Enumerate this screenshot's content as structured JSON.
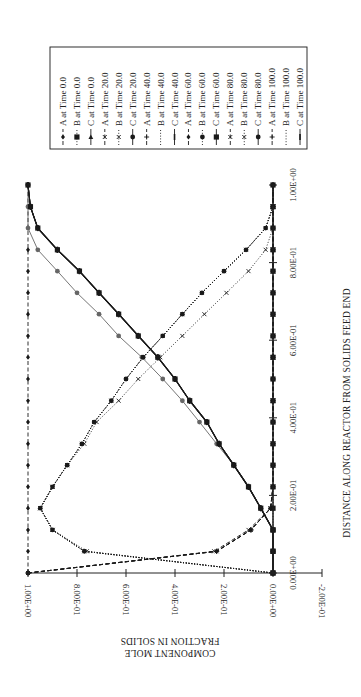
{
  "chart_data": {
    "type": "line",
    "orientation": "rotated 90° counter-clockwise (distance axis vertical, mole fraction axis horizontal)",
    "title": "",
    "xlabel": "DISTANCE ALONG REACTOR FROM SOLIDS FEED END",
    "ylabel": "COMPONENT MOLE FRACTION IN SOLIDS",
    "xlim": [
      0,
      1.0
    ],
    "ylim": [
      -0.2,
      1.0
    ],
    "x_ticks": [
      "0.00E+00",
      "2.00E-01",
      "4.00E-01",
      "6.00E-01",
      "8.00E-01",
      "1.00E+00"
    ],
    "y_ticks": [
      "1.00E+00",
      "8.00E-01",
      "6.00E-01",
      "4.00E-01",
      "2.00E-01",
      "0.00E+00",
      "-2.00E-01"
    ],
    "grid": false,
    "legend_position": "top-right (rotated)",
    "x": [
      0.0,
      0.056,
      0.111,
      0.167,
      0.222,
      0.278,
      0.333,
      0.389,
      0.444,
      0.5,
      0.556,
      0.611,
      0.667,
      0.722,
      0.778,
      0.833,
      0.889,
      0.944,
      1.0
    ],
    "series": [
      {
        "name": "A at Time 0.0",
        "style": "dashed",
        "marker": "diamond",
        "values": [
          1,
          1,
          1,
          1,
          1,
          1,
          1,
          1,
          1,
          1,
          1,
          1,
          1,
          1,
          1,
          1,
          1,
          1,
          1
        ]
      },
      {
        "name": "B at Time 0.0",
        "style": "dotted",
        "marker": "square",
        "values": [
          0,
          0,
          0,
          0,
          0,
          0,
          0,
          0,
          0,
          0,
          0,
          0,
          0,
          0,
          0,
          0,
          0,
          0,
          0
        ]
      },
      {
        "name": "C at Time 0.0",
        "style": "solid",
        "marker": "triangle",
        "values": [
          0,
          0,
          0,
          0,
          0,
          0,
          0,
          0,
          0,
          0,
          0,
          0,
          0,
          0,
          0,
          0,
          0,
          0,
          0
        ]
      },
      {
        "name": "A at Time 20.0",
        "style": "dashed",
        "marker": "x",
        "values": [
          1.0,
          0.24,
          0.1,
          0.01,
          0,
          0,
          0,
          0,
          0,
          0,
          0,
          0,
          0,
          0,
          0,
          0,
          0,
          0,
          0
        ]
      },
      {
        "name": "B at Time 20.0",
        "style": "dotted",
        "marker": "x",
        "values": [
          0,
          0.76,
          0.9,
          0.95,
          0.9,
          0.84,
          0.77,
          0.72,
          0.63,
          0.55,
          0.46,
          0.37,
          0.28,
          0.19,
          0.1,
          0.03,
          0,
          0,
          0
        ]
      },
      {
        "name": "C at Time 20.0",
        "style": "solid",
        "marker": "circle",
        "values": [
          0,
          0,
          0,
          0.05,
          0.1,
          0.16,
          0.23,
          0.3,
          0.37,
          0.45,
          0.535,
          0.63,
          0.71,
          0.8,
          0.88,
          0.96,
          1.0,
          1.0,
          1.0
        ]
      },
      {
        "name": "A at Time 40.0",
        "style": "dashed",
        "marker": "plus",
        "values": [
          1.0,
          0.23,
          0.09,
          0.01,
          0,
          0,
          0,
          0,
          0,
          0,
          0,
          0,
          0,
          0,
          0,
          0,
          0,
          0,
          0
        ]
      },
      {
        "name": "B at Time 40.0",
        "style": "dotted",
        "marker": "none",
        "values": [
          0,
          0.77,
          0.9,
          0.95,
          0.9,
          0.84,
          0.78,
          0.73,
          0.66,
          0.6,
          0.53,
          0.45,
          0.37,
          0.29,
          0.2,
          0.11,
          0.03,
          0,
          0
        ]
      },
      {
        "name": "C at Time 40.0",
        "style": "solid",
        "marker": "bar",
        "values": [
          0,
          0,
          0,
          0.05,
          0.1,
          0.16,
          0.22,
          0.27,
          0.34,
          0.4,
          0.47,
          0.55,
          0.63,
          0.71,
          0.79,
          0.88,
          0.96,
          0.99,
          1.0
        ]
      },
      {
        "name": "A at Time 60.0",
        "style": "dashed",
        "marker": "diamond",
        "values": [
          1.0,
          0.23,
          0.09,
          0.01,
          0,
          0,
          0,
          0,
          0,
          0,
          0,
          0,
          0,
          0,
          0,
          0,
          0,
          0,
          0
        ]
      },
      {
        "name": "B at Time 60.0",
        "style": "dotted",
        "marker": "circle",
        "values": [
          0,
          0.77,
          0.9,
          0.95,
          0.9,
          0.84,
          0.78,
          0.73,
          0.66,
          0.6,
          0.53,
          0.45,
          0.37,
          0.29,
          0.2,
          0.11,
          0.03,
          0,
          0
        ]
      },
      {
        "name": "C at Time 60.0",
        "style": "solid",
        "marker": "square",
        "values": [
          0,
          0,
          0,
          0.05,
          0.1,
          0.16,
          0.22,
          0.27,
          0.34,
          0.4,
          0.47,
          0.55,
          0.63,
          0.71,
          0.79,
          0.88,
          0.96,
          0.99,
          1.0
        ]
      },
      {
        "name": "A at Time 80.0",
        "style": "dashed",
        "marker": "x",
        "values": [
          1.0,
          0.23,
          0.09,
          0.01,
          0,
          0,
          0,
          0,
          0,
          0,
          0,
          0,
          0,
          0,
          0,
          0,
          0,
          0,
          0
        ]
      },
      {
        "name": "B at Time 80.0",
        "style": "dotted",
        "marker": "x",
        "values": [
          0,
          0.77,
          0.9,
          0.95,
          0.9,
          0.84,
          0.78,
          0.73,
          0.66,
          0.6,
          0.53,
          0.45,
          0.37,
          0.29,
          0.2,
          0.11,
          0.03,
          0,
          0
        ]
      },
      {
        "name": "C at Time 80.0",
        "style": "solid",
        "marker": "circle",
        "values": [
          0,
          0,
          0,
          0.05,
          0.1,
          0.16,
          0.22,
          0.27,
          0.34,
          0.4,
          0.47,
          0.55,
          0.63,
          0.71,
          0.79,
          0.88,
          0.96,
          0.99,
          1.0
        ]
      },
      {
        "name": "A at Time 100.0",
        "style": "dashed",
        "marker": "plus",
        "values": [
          1.0,
          0.23,
          0.09,
          0.01,
          0,
          0,
          0,
          0,
          0,
          0,
          0,
          0,
          0,
          0,
          0,
          0,
          0,
          0,
          0
        ]
      },
      {
        "name": "B at Time 100.0",
        "style": "dotted",
        "marker": "none",
        "values": [
          0,
          0.77,
          0.9,
          0.95,
          0.9,
          0.84,
          0.78,
          0.73,
          0.66,
          0.6,
          0.53,
          0.45,
          0.37,
          0.29,
          0.2,
          0.11,
          0.03,
          0,
          0
        ]
      },
      {
        "name": "C at Time 100.0",
        "style": "solid",
        "marker": "bar",
        "values": [
          0,
          0,
          0,
          0.05,
          0.1,
          0.16,
          0.22,
          0.27,
          0.34,
          0.4,
          0.47,
          0.55,
          0.63,
          0.71,
          0.79,
          0.88,
          0.96,
          0.99,
          1.0
        ]
      }
    ]
  },
  "legend": {
    "items": [
      "A at Time 0.0",
      "B at Time 0.0",
      "C at Time 0.0",
      "A at Time 20.0",
      "B at Time 20.0",
      "C at Time 20.0",
      "A at Time 40.0",
      "B at Time 40.0",
      "C at Time 40.0",
      "A at Time 60.0",
      "B at Time 60.0",
      "C at Time 60.0",
      "A at Time 80.0",
      "B at Time 80.0",
      "C at Time 80.0",
      "A at Time 100.0",
      "B at Time 100.0",
      "C at Time 100.0"
    ]
  },
  "axes": {
    "y_title_line1": "COMPONENT MOLE",
    "y_title_line2": "FRACTION IN SOLIDS",
    "x_title": "DISTANCE ALONG REACTOR FROM SOLIDS FEED END"
  },
  "colors": {
    "ink": "#1a1a1a",
    "gray_line": "#666666",
    "background": "#ffffff"
  }
}
